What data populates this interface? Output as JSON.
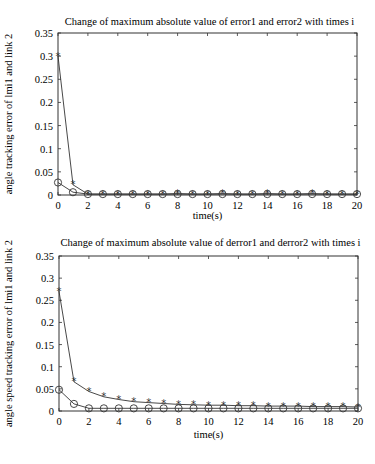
{
  "chart_data": [
    {
      "type": "line",
      "title": "Change of maximum absolute value of error1 and error2 with times i",
      "xlabel": "time(s)",
      "ylabel": "angle tracking error of  lmi1 and  link 2",
      "xlim": [
        0,
        20
      ],
      "ylim": [
        0,
        0.35
      ],
      "xticks": [
        0,
        2,
        4,
        6,
        8,
        10,
        12,
        14,
        16,
        18,
        20
      ],
      "yticks": [
        "0",
        "0.05",
        "0.1",
        "0.15",
        "0.2",
        "0.25",
        "0.3",
        "0.35"
      ],
      "grid": false,
      "x": [
        0,
        1,
        2,
        3,
        4,
        5,
        6,
        7,
        8,
        9,
        10,
        11,
        12,
        13,
        14,
        15,
        16,
        17,
        18,
        19,
        20
      ],
      "series": [
        {
          "name": "error1 (star)",
          "marker": "*",
          "values": [
            0.3,
            0.022,
            0.002,
            0.002,
            0.002,
            0.002,
            0.002,
            0.002,
            0.003,
            0.002,
            0.002,
            0.003,
            0.002,
            0.002,
            0.003,
            0.002,
            0.002,
            0.003,
            0.002,
            0.002,
            0.002
          ]
        },
        {
          "name": "error2 (circle)",
          "marker": "o",
          "values": [
            0.027,
            0.006,
            0.002,
            0.002,
            0.002,
            0.002,
            0.002,
            0.002,
            0.002,
            0.002,
            0.002,
            0.002,
            0.002,
            0.002,
            0.002,
            0.002,
            0.002,
            0.002,
            0.002,
            0.002,
            0.002
          ]
        }
      ]
    },
    {
      "type": "line",
      "title": "Change of maximum absolute value of derror1 and derror2 with times i",
      "xlabel": "time(s)",
      "ylabel": "angle speed tracking error of  lmi1 and  link 2",
      "xlim": [
        0,
        20
      ],
      "ylim": [
        0,
        0.35
      ],
      "xticks": [
        0,
        2,
        4,
        6,
        8,
        10,
        12,
        14,
        16,
        18,
        20
      ],
      "yticks": [
        "0",
        "0.05",
        "0.1",
        "0.15",
        "0.2",
        "0.25",
        "0.3",
        "0.35"
      ],
      "grid": false,
      "x": [
        0,
        1,
        2,
        3,
        4,
        5,
        6,
        7,
        8,
        9,
        10,
        11,
        12,
        13,
        14,
        15,
        16,
        17,
        18,
        19,
        20
      ],
      "series": [
        {
          "name": "derror1 (star)",
          "marker": "*",
          "values": [
            0.27,
            0.066,
            0.044,
            0.032,
            0.026,
            0.021,
            0.019,
            0.017,
            0.015,
            0.014,
            0.013,
            0.013,
            0.012,
            0.012,
            0.011,
            0.011,
            0.011,
            0.01,
            0.01,
            0.01,
            0.009
          ]
        },
        {
          "name": "derror2 (circle)",
          "marker": "o",
          "values": [
            0.048,
            0.016,
            0.006,
            0.006,
            0.006,
            0.006,
            0.006,
            0.006,
            0.006,
            0.006,
            0.006,
            0.006,
            0.006,
            0.006,
            0.006,
            0.006,
            0.006,
            0.006,
            0.006,
            0.006,
            0.006
          ]
        }
      ]
    }
  ],
  "layout": {
    "plots": [
      {
        "x0": 58,
        "x1": 357,
        "y0": 195,
        "y1": 33,
        "title_y": 25,
        "xlabel_y": 219
      },
      {
        "x0": 59,
        "x1": 358,
        "y0": 411,
        "y1": 256,
        "title_y": 246,
        "xlabel_y": 438
      }
    ],
    "line_color": "#333333"
  },
  "caption": ""
}
